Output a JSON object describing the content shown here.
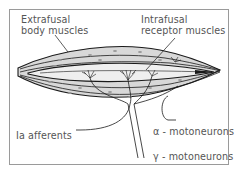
{
  "diagram": {
    "labels": {
      "extrafusal_line1": "Extrafusal",
      "extrafusal_line2": "body muscles",
      "intrafusal_line1": "Intrafusal",
      "intrafusal_line2": "receptor muscles",
      "ia_afferents": "Ia afferents",
      "alpha_motoneurons": "α - motoneurons",
      "gamma_motoneurons": "γ - motoneurons"
    },
    "colors": {
      "muscle_fill": "#d8d8d8",
      "spindle_fill": "#efefef",
      "outline": "#1a1a1a",
      "label_text": "#555555",
      "frame_border": "#9a9a9a"
    }
  }
}
